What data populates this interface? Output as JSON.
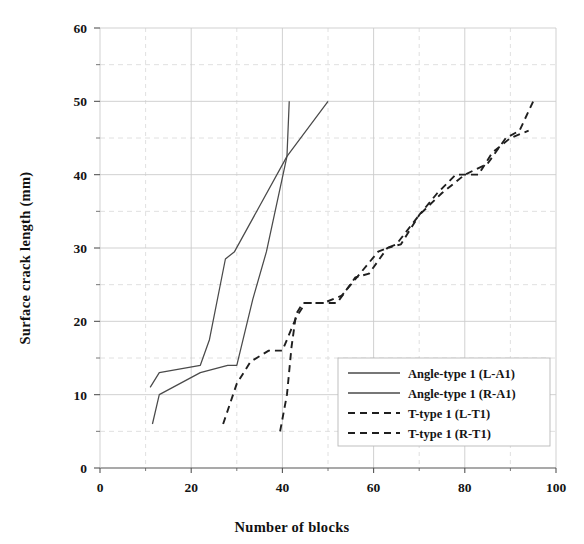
{
  "chart_data": {
    "type": "line",
    "title": "",
    "xlabel": "Number of blocks",
    "ylabel": "Surface crack length (mm)",
    "xlim": [
      0,
      100
    ],
    "ylim": [
      0,
      60
    ],
    "xticks": [
      0,
      20,
      40,
      60,
      80,
      100
    ],
    "yticks": [
      0,
      10,
      20,
      30,
      40,
      50,
      60
    ],
    "xminor_step": 10,
    "yminor_step": 5,
    "grid": true,
    "grid_major": true,
    "grid_minor": true,
    "legend_position": "lower-right-inside",
    "series": [
      {
        "name": "Angle-type 1 (L-A1)",
        "style": "solid",
        "color": "#4a4a4a",
        "points": [
          [
            11.0,
            11.0
          ],
          [
            13.0,
            13.0
          ],
          [
            22.0,
            14.0
          ],
          [
            24.0,
            17.5
          ],
          [
            27.5,
            28.5
          ],
          [
            29.5,
            29.5
          ],
          [
            41.0,
            42.5
          ],
          [
            41.5,
            50.0
          ]
        ]
      },
      {
        "name": "Angle-type 1 (R-A1)",
        "style": "solid",
        "color": "#4a4a4a",
        "points": [
          [
            11.5,
            6.0
          ],
          [
            13.0,
            10.0
          ],
          [
            22.0,
            13.0
          ],
          [
            28.0,
            14.0
          ],
          [
            30.0,
            14.0
          ],
          [
            33.5,
            23.0
          ],
          [
            36.5,
            29.5
          ],
          [
            41.0,
            42.5
          ],
          [
            50.0,
            50.0
          ]
        ]
      },
      {
        "name": "T-type 1 (L-T1)",
        "style": "dashed",
        "color": "#1f1f1f",
        "points": [
          [
            27.0,
            6.0
          ],
          [
            30.0,
            11.5
          ],
          [
            33.0,
            14.5
          ],
          [
            37.0,
            16.0
          ],
          [
            40.0,
            16.0
          ],
          [
            43.0,
            20.5
          ],
          [
            45.0,
            22.5
          ],
          [
            52.0,
            22.5
          ],
          [
            56.0,
            26.0
          ],
          [
            59.0,
            26.5
          ],
          [
            63.0,
            30.0
          ],
          [
            66.0,
            30.5
          ],
          [
            70.0,
            34.5
          ],
          [
            74.0,
            37.5
          ],
          [
            78.0,
            40.0
          ],
          [
            83.0,
            40.0
          ],
          [
            86.0,
            43.0
          ],
          [
            90.0,
            45.0
          ],
          [
            94.0,
            46.0
          ]
        ]
      },
      {
        "name": "T-type 1 (R-T1)",
        "style": "dashed",
        "color": "#1f1f1f",
        "points": [
          [
            39.5,
            5.0
          ],
          [
            41.0,
            10.0
          ],
          [
            42.0,
            16.5
          ],
          [
            43.0,
            21.0
          ],
          [
            44.5,
            22.5
          ],
          [
            49.0,
            22.5
          ],
          [
            53.0,
            23.5
          ],
          [
            57.0,
            26.5
          ],
          [
            61.0,
            29.5
          ],
          [
            65.0,
            30.5
          ],
          [
            70.0,
            34.5
          ],
          [
            75.0,
            37.5
          ],
          [
            80.0,
            40.0
          ],
          [
            85.0,
            41.5
          ],
          [
            89.0,
            45.0
          ],
          [
            92.0,
            46.0
          ],
          [
            95.0,
            50.0
          ]
        ]
      }
    ],
    "legend_entries": [
      {
        "label": "Angle-type 1 (L-A1)",
        "style": "solid"
      },
      {
        "label": "Angle-type 1 (R-A1)",
        "style": "solid"
      },
      {
        "label": "T-type 1 (L-T1)",
        "style": "dashed"
      },
      {
        "label": "T-type 1 (R-T1)",
        "style": "dashed"
      }
    ],
    "colors": {
      "solid_line": "#4a4a4a",
      "dashed_line": "#1f1f1f",
      "axis": "#555555",
      "grid_major": "#cccccc",
      "grid_minor": "#dddddd",
      "background": "#ffffff",
      "text": "#141414"
    }
  }
}
